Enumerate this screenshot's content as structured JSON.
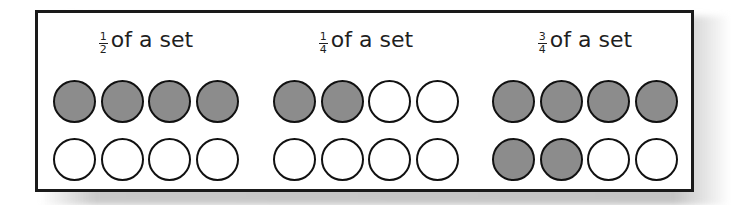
{
  "diagram": {
    "colors": {
      "shaded": "#8c8c8c",
      "unshaded": "#ffffff",
      "outline": "#111111"
    },
    "groups": [
      {
        "numerator": "1",
        "denominator": "2",
        "text": "of a set",
        "rows": [
          [
            "filled",
            "filled",
            "filled",
            "filled"
          ],
          [
            "empty",
            "empty",
            "empty",
            "empty"
          ]
        ]
      },
      {
        "numerator": "1",
        "denominator": "4",
        "text": "of a set",
        "rows": [
          [
            "filled",
            "filled",
            "empty",
            "empty"
          ],
          [
            "empty",
            "empty",
            "empty",
            "empty"
          ]
        ]
      },
      {
        "numerator": "3",
        "denominator": "4",
        "text": "of a set",
        "rows": [
          [
            "filled",
            "filled",
            "filled",
            "filled"
          ],
          [
            "filled",
            "filled",
            "empty",
            "empty"
          ]
        ]
      }
    ]
  }
}
